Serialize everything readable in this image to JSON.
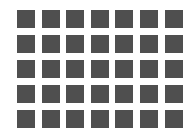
{
  "grid": {
    "columns": 7,
    "rows": 5,
    "cell_color": "#4f4f4f",
    "background": "#ffffff"
  }
}
